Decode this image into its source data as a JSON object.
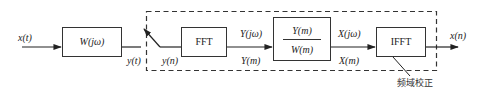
{
  "diagram": {
    "type": "block-diagram",
    "colors": {
      "stroke": "#333333",
      "text": "#222222",
      "background": "#ffffff"
    },
    "input": {
      "label": "x(t)"
    },
    "blocks": {
      "channel": {
        "label": "W(jω)"
      },
      "fft": {
        "label": "FFT"
      },
      "divide": {
        "numerator": "Y(m)",
        "denominator": "W(m)"
      },
      "ifft": {
        "label": "IFFT"
      }
    },
    "signals": {
      "y_t": "y(t)",
      "y_n": "y(n)",
      "Y_jw": "Y(jω)",
      "Y_m": "Y(m)",
      "X_jw": "X(jω)",
      "X_m": "X(m)",
      "output": "x(n)"
    },
    "group": {
      "label": "频域校正",
      "style": "dashed"
    }
  }
}
